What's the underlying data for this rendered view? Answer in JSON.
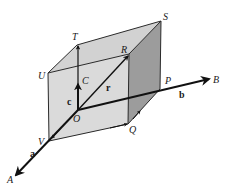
{
  "figure": {
    "colors": {
      "front_face": "#d9d9d9",
      "top_face": "#cfcfcf",
      "right_face": "#9a9a9a",
      "bottom_face": "#c4c4c4",
      "ink": "#111111"
    },
    "points": {
      "O": "O",
      "A": "A",
      "B": "B",
      "C": "C",
      "P": "P",
      "Q": "Q",
      "R": "R",
      "S": "S",
      "T": "T",
      "U": "U",
      "V": "V"
    },
    "vectors": {
      "a": "a",
      "b": "b",
      "c": "c",
      "r": "r"
    }
  }
}
